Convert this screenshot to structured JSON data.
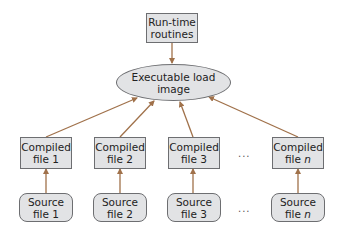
{
  "diagram": {
    "colors": {
      "box_fill": "#e2e3e5",
      "box_border": "#6d6e71",
      "arrow": "#a0714a"
    },
    "runtime": {
      "line1": "Run-time",
      "line2": "routines"
    },
    "load_image": {
      "label": "Executable load image"
    },
    "compiled": [
      {
        "line1": "Compiled",
        "line2a": "file ",
        "line2b": "1"
      },
      {
        "line1": "Compiled",
        "line2a": "file ",
        "line2b": "2"
      },
      {
        "line1": "Compiled",
        "line2a": "file ",
        "line2b": "3"
      },
      {
        "line1": "Compiled",
        "line2a": "file ",
        "line2b": "n"
      }
    ],
    "sources": [
      {
        "line1": "Source",
        "line2a": "file ",
        "line2b": "1"
      },
      {
        "line1": "Source",
        "line2a": "file ",
        "line2b": "2"
      },
      {
        "line1": "Source",
        "line2a": "file ",
        "line2b": "3"
      },
      {
        "line1": "Source",
        "line2a": "file ",
        "line2b": "n"
      }
    ],
    "ellipsis_compiled": "...",
    "ellipsis_source": "...",
    "edges": [
      {
        "from": "runtime-routines",
        "to": "executable-load-image"
      },
      {
        "from": "compiled-file-1",
        "to": "executable-load-image"
      },
      {
        "from": "compiled-file-2",
        "to": "executable-load-image"
      },
      {
        "from": "compiled-file-3",
        "to": "executable-load-image"
      },
      {
        "from": "compiled-file-n",
        "to": "executable-load-image"
      },
      {
        "from": "source-file-1",
        "to": "compiled-file-1"
      },
      {
        "from": "source-file-2",
        "to": "compiled-file-2"
      },
      {
        "from": "source-file-3",
        "to": "compiled-file-3"
      },
      {
        "from": "source-file-n",
        "to": "compiled-file-n"
      }
    ]
  }
}
